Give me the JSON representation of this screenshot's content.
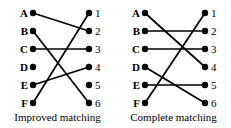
{
  "figure": {
    "background_color": "#ffffff",
    "ink_color": "#000000"
  },
  "panels": [
    {
      "id": "improved-matching",
      "caption": "Improved matching",
      "left_labels": [
        "A",
        "B",
        "C",
        "D",
        "E",
        "F"
      ],
      "right_labels": [
        "1",
        "2",
        "3",
        "4",
        "5",
        "6"
      ],
      "edges": [
        {
          "from": "A",
          "to": "2"
        },
        {
          "from": "B",
          "to": "6"
        },
        {
          "from": "C",
          "to": "3"
        },
        {
          "from": "E",
          "to": "4"
        },
        {
          "from": "F",
          "to": "1"
        }
      ],
      "unmatched_left": [
        "D"
      ],
      "unmatched_right": [
        "5"
      ]
    },
    {
      "id": "complete-matching",
      "caption": "Complete matching",
      "left_labels": [
        "A",
        "B",
        "C",
        "D",
        "E",
        "F"
      ],
      "right_labels": [
        "1",
        "2",
        "3",
        "4",
        "5",
        "6"
      ],
      "edges": [
        {
          "from": "A",
          "to": "4"
        },
        {
          "from": "B",
          "to": "2"
        },
        {
          "from": "C",
          "to": "3"
        },
        {
          "from": "D",
          "to": "6"
        },
        {
          "from": "E",
          "to": "5"
        },
        {
          "from": "F",
          "to": "1"
        }
      ],
      "unmatched_left": [],
      "unmatched_right": []
    }
  ],
  "geometry": {
    "left_column_x": 33,
    "right_column_x": 89,
    "first_row_y": 13,
    "row_spacing": 18,
    "node_radius": 3.2,
    "edge_width": 1.7
  }
}
